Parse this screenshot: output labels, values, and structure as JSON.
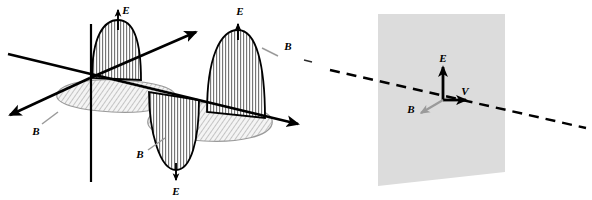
{
  "figure": {
    "width": 592,
    "height": 200,
    "background": "#ffffff"
  },
  "colors": {
    "stroke": "#000000",
    "leader_gray": "#9a9a9a",
    "hatch_gray": "#6f6f6f",
    "plane_fill": "#dcdcdc",
    "plane_fill_light": "#e6e6e6",
    "ellipse_fill": "#f2f2f2"
  },
  "panels": [
    {
      "id": "wave-3d",
      "name": "electromagnetic-wave-3d-panel",
      "labels": [
        {
          "id": "e-crest-1",
          "text": "E",
          "x": 123,
          "y": 14,
          "role": "electric-field"
        },
        {
          "id": "e-crest-2",
          "text": "E",
          "x": 240,
          "y": 18,
          "role": "electric-field"
        },
        {
          "id": "e-trough-1",
          "text": "E",
          "x": 176,
          "y": 188,
          "role": "electric-field"
        },
        {
          "id": "b-left",
          "text": "B",
          "x": 36,
          "y": 132,
          "role": "magnetic-field"
        },
        {
          "id": "b-middle",
          "text": "B",
          "x": 139,
          "y": 155,
          "role": "magnetic-field"
        },
        {
          "id": "b-right",
          "text": "B",
          "x": 286,
          "y": 48,
          "role": "magnetic-field"
        }
      ],
      "arrows": [
        {
          "id": "e-arrow-crest-1",
          "direction": "up",
          "label": "E"
        },
        {
          "id": "e-arrow-crest-2",
          "direction": "up",
          "label": "E"
        },
        {
          "id": "e-arrow-trough-1",
          "direction": "down",
          "label": "E"
        }
      ],
      "axes": [
        {
          "id": "propagation-axis",
          "direction": "right",
          "arrowhead": true
        },
        {
          "id": "depth-axis-front",
          "direction": "down-left",
          "arrowhead": true
        },
        {
          "id": "depth-axis-back",
          "direction": "up-right",
          "arrowhead": true
        },
        {
          "id": "vertical-axis",
          "direction": "vertical",
          "arrowhead": false
        }
      ],
      "hatching": {
        "e_lobes": "vertical",
        "b_ellipses": "diagonal"
      }
    },
    {
      "id": "wavefront-plane",
      "name": "wavefront-plane-panel",
      "labels": [
        {
          "id": "e-plane",
          "text": "E",
          "x": 441,
          "y": 61,
          "role": "electric-field"
        },
        {
          "id": "v-plane",
          "text": "V",
          "x": 463,
          "y": 94,
          "role": "velocity"
        },
        {
          "id": "b-plane",
          "text": "B",
          "x": 411,
          "y": 109,
          "role": "magnetic-field"
        }
      ],
      "arrows": [
        {
          "id": "e-vector",
          "direction": "up",
          "label": "E",
          "color": "#000000"
        },
        {
          "id": "v-vector",
          "direction": "right",
          "label": "V",
          "color": "#000000"
        },
        {
          "id": "b-vector",
          "direction": "down-left",
          "label": "B",
          "color": "#9a9a9a"
        }
      ],
      "plane": {
        "id": "wavefront",
        "shape": "parallelogram",
        "fill": "#dcdcdc"
      },
      "ray": {
        "id": "propagation-ray",
        "style": "dashed",
        "direction": "left-to-right-descending"
      }
    }
  ]
}
